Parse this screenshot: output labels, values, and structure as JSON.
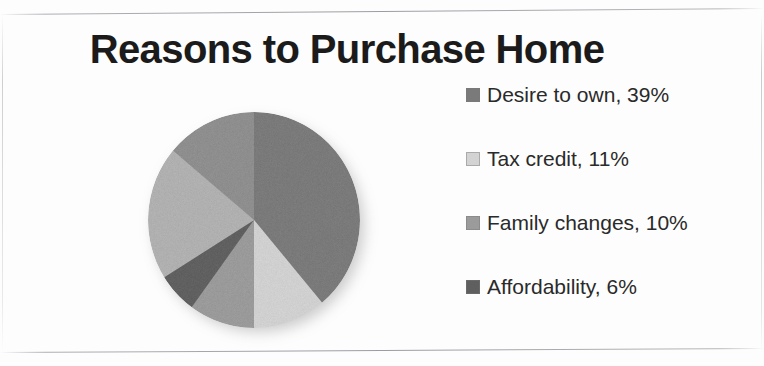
{
  "chart_data": {
    "type": "pie",
    "title": "Reasons to Purchase Home",
    "legend_position": "right",
    "categories": [
      "Desire to own",
      "Tax credit",
      "Family changes",
      "Affordability",
      "Other",
      "Remaining"
    ],
    "values": [
      39,
      11,
      10,
      6,
      20,
      14
    ],
    "labels": [
      "Desire to own, 39%",
      "Tax credit, 11%",
      "Family changes, 10%",
      "Affordability, 6%"
    ],
    "colors": [
      "#7a7a7a",
      "#d0d0d0",
      "#9a9a9a",
      "#606060",
      "#b0b0b0",
      "#8e8e8e"
    ],
    "start_angle": 0,
    "direction": "clockwise",
    "slices": [
      {
        "name": "Desire to own",
        "value": 39,
        "color": "#7a7a7a",
        "start_deg": 0,
        "end_deg": 140
      },
      {
        "name": "Tax credit",
        "value": 11,
        "color": "#d0d0d0",
        "start_deg": 140,
        "end_deg": 180
      },
      {
        "name": "Family changes",
        "value": 10,
        "color": "#9a9a9a",
        "start_deg": 180,
        "end_deg": 216
      },
      {
        "name": "Affordability",
        "value": 6,
        "color": "#606060",
        "start_deg": 216,
        "end_deg": 238
      },
      {
        "name": "Other",
        "value": 20,
        "color": "#b0b0b0",
        "start_deg": 238,
        "end_deg": 310
      },
      {
        "name": "Remaining",
        "value": 14,
        "color": "#8e8e8e",
        "start_deg": 310,
        "end_deg": 360
      }
    ]
  },
  "title": "Reasons to Purchase Home",
  "legend": {
    "items": [
      {
        "label": "Desire to own, 39%",
        "name": "Desire to own",
        "percent": "39%",
        "color": "#7a7a7a"
      },
      {
        "label": "Tax credit, 11%",
        "name": "Tax credit",
        "percent": "11%",
        "color": "#d3d3d3"
      },
      {
        "label": "Family changes, 10%",
        "name": "Family changes",
        "percent": "10%",
        "color": "#9b9b9b"
      },
      {
        "label": "Affordability, 6%",
        "name": "Affordability",
        "percent": "6%",
        "color": "#5f5f5f"
      }
    ]
  }
}
